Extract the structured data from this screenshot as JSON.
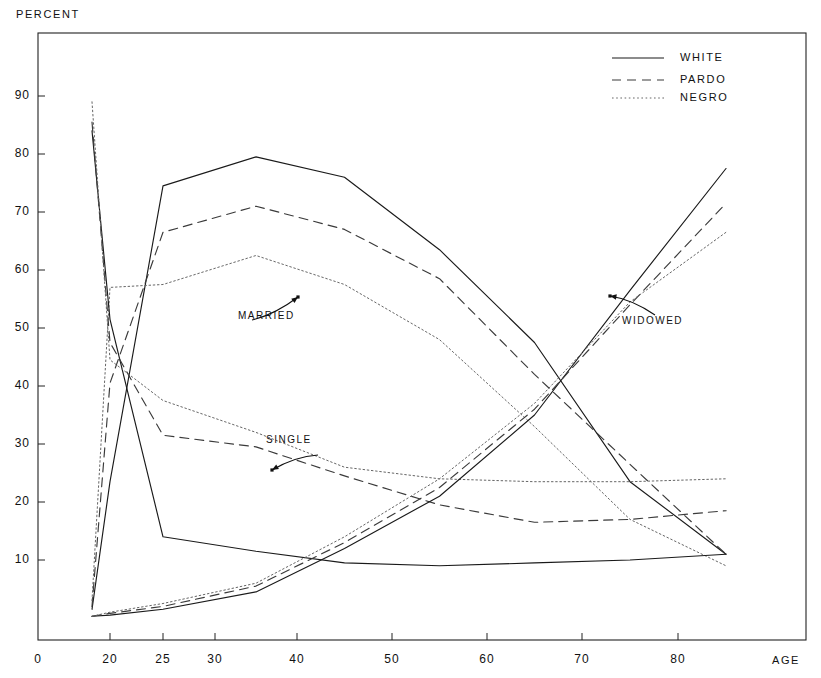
{
  "axis": {
    "y_title": "PERCENT",
    "x_title": "AGE",
    "y_ticks": [
      "10",
      "20",
      "30",
      "40",
      "50",
      "60",
      "70",
      "80",
      "90"
    ],
    "x_ticks": [
      "0",
      "20",
      "25",
      "30",
      "40",
      "50",
      "60",
      "70",
      "80"
    ],
    "y_origin_label": "0"
  },
  "legend": {
    "items": [
      {
        "label": "WHITE",
        "style": "solid"
      },
      {
        "label": "PARDO",
        "style": "dashed"
      },
      {
        "label": "NEGRO",
        "style": "dotted"
      }
    ]
  },
  "annotations": [
    {
      "label": "MARRIED"
    },
    {
      "label": "SINGLE"
    },
    {
      "label": "WIDOWED"
    }
  ],
  "chart_data": {
    "type": "line",
    "title": "",
    "xlabel": "AGE",
    "ylabel": "PERCENT",
    "xlim": [
      0,
      88
    ],
    "ylim": [
      0,
      100
    ],
    "grid": false,
    "legend_position": "top-right",
    "x": [
      15,
      20,
      25,
      35,
      45,
      55,
      65,
      75,
      85
    ],
    "groups": [
      {
        "name": "MARRIED",
        "series": [
          {
            "name": "WHITE",
            "style": "solid",
            "values": [
              1.5,
              23.5,
              74.5,
              79.5,
              76.0,
              63.5,
              47.5,
              23.5,
              11.0
            ]
          },
          {
            "name": "PARDO",
            "style": "dashed",
            "values": [
              2.0,
              40.5,
              66.5,
              71.0,
              67.0,
              58.5,
              42.0,
              26.5,
              11.0
            ]
          },
          {
            "name": "NEGRO",
            "style": "dotted",
            "values": [
              3.0,
              57.0,
              57.5,
              62.5,
              57.5,
              48.0,
              33.0,
              17.0,
              9.0
            ]
          }
        ]
      },
      {
        "name": "SINGLE",
        "series": [
          {
            "name": "WHITE",
            "style": "solid",
            "values": [
              84.0,
              51.5,
              14.0,
              11.5,
              9.5,
              9.0,
              9.5,
              10.0,
              11.0
            ]
          },
          {
            "name": "PARDO",
            "style": "dashed",
            "values": [
              85.5,
              47.5,
              31.5,
              29.5,
              24.5,
              19.5,
              16.5,
              17.0,
              18.5
            ]
          },
          {
            "name": "NEGRO",
            "style": "dotted",
            "values": [
              89.0,
              44.5,
              37.5,
              32.0,
              26.0,
              24.0,
              23.5,
              23.5,
              24.0
            ]
          }
        ]
      },
      {
        "name": "WIDOWED",
        "series": [
          {
            "name": "WHITE",
            "style": "solid",
            "values": [
              0.3,
              0.5,
              1.5,
              4.5,
              12.0,
              21.0,
              35.0,
              56.5,
              77.5
            ]
          },
          {
            "name": "PARDO",
            "style": "dashed",
            "values": [
              0.3,
              0.8,
              2.0,
              5.5,
              13.0,
              22.5,
              36.0,
              54.0,
              71.5
            ]
          },
          {
            "name": "NEGRO",
            "style": "dotted",
            "values": [
              0.3,
              1.0,
              2.5,
              6.0,
              14.0,
              24.0,
              37.0,
              54.5,
              66.5
            ]
          }
        ]
      }
    ]
  }
}
